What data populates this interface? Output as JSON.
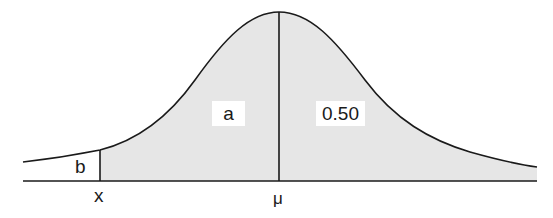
{
  "diagram": {
    "type": "normal-distribution-curve",
    "shaded_region": "area under curve to the right of x",
    "colors": {
      "fill": "#e6e6e6",
      "line": "#1a1a1a",
      "background": "#ffffff"
    },
    "regions": [
      {
        "id": "left-tail",
        "label": "b"
      },
      {
        "id": "x-to-mean",
        "label": "a"
      },
      {
        "id": "right-half",
        "label": "0.50"
      }
    ],
    "axis_labels": {
      "x": "x",
      "mu": "μ"
    }
  }
}
